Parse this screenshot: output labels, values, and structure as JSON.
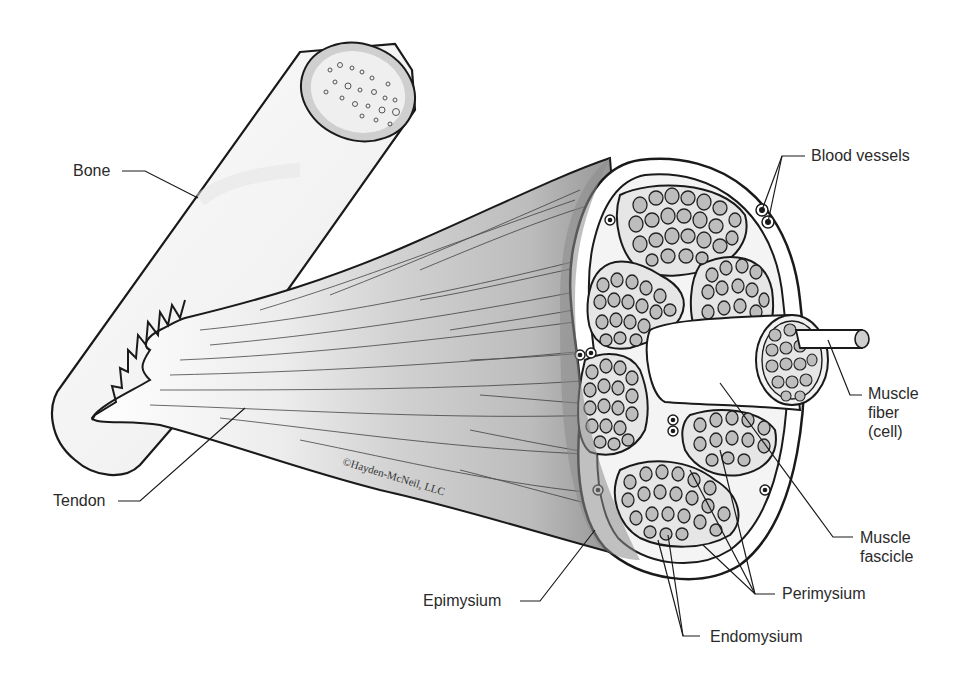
{
  "figure": {
    "copyright": "©Hayden-McNeil, LLC"
  },
  "labels": {
    "bone": "Bone",
    "tendon": "Tendon",
    "blood_vessels": "Blood vessels",
    "muscle_fiber": "Muscle\nfiber\n(cell)",
    "muscle_fascicle": "Muscle\nfascicle",
    "epimysium": "Epimysium",
    "perimysium": "Perimysium",
    "endomysium": "Endomysium"
  },
  "colors": {
    "outline": "#1a1a1a",
    "muscle_light": "#dcdcdc",
    "muscle_mid": "#c4c4c4",
    "muscle_dark": "#8c8c8c",
    "fiber_fill": "#bdbdbd",
    "bone_fill": "#f6f6f6",
    "marrow_fill": "#cfcfcf"
  }
}
